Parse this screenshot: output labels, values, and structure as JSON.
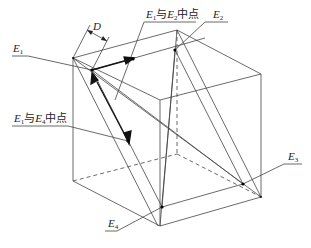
{
  "diagram": {
    "type": "cube-geometry",
    "line_color": "#333333",
    "labels": {
      "e1": {
        "main": "E",
        "sub": "1"
      },
      "e2": {
        "main": "E",
        "sub": "2"
      },
      "e3": {
        "main": "E",
        "sub": "3"
      },
      "e4": {
        "main": "E",
        "sub": "4"
      },
      "d": "D",
      "mid12": {
        "a": "E",
        "a_sub": "1",
        "conj": "与",
        "b": "E",
        "b_sub": "2",
        "tail": "中点"
      },
      "mid14": {
        "a": "E",
        "a_sub": "1",
        "conj": "与",
        "b": "E",
        "b_sub": "4",
        "tail": "中点"
      }
    }
  }
}
